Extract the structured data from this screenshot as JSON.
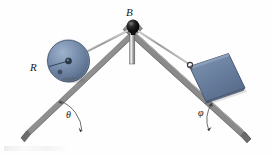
{
  "figure": {
    "type": "engineering-mechanics-diagram",
    "labels": {
      "apex": "B",
      "disk_radius": "R",
      "left_angle": "θ",
      "right_angle": "φ"
    },
    "colors": {
      "beam_light": "#d8d8d8",
      "beam_mid": "#a9a9a9",
      "beam_dark": "#6f6f6f",
      "body_fill": "#6f86a6",
      "body_dark": "#4f6480",
      "body_light": "#8ea2be",
      "pin": "#101010",
      "cable": "#9a9a9a",
      "baseline": "#8a8a8a",
      "label": "#1a1a1a"
    },
    "geometry": {
      "apex": [
        133,
        27
      ],
      "left_foot": [
        22,
        133
      ],
      "right_foot": [
        250,
        133
      ],
      "baseline_y": 131,
      "disk_center": [
        68,
        61
      ],
      "disk_radius_px": 21,
      "block_center": [
        206,
        72
      ],
      "theta_deg": 44,
      "phi_deg": 43
    },
    "elements": {
      "left_beam": "left-inclined-beam",
      "right_beam": "right-inclined-beam",
      "apex_post": "apex-vertical-post",
      "pin": "apex-pin-pulley",
      "left_cable": "cable-disk-to-apex",
      "right_cable": "cable-apex-to-block",
      "disk": "disk-on-left-incline",
      "block": "block-on-right-incline",
      "hook": "block-cable-hook",
      "baseline": "ground-horizontal-line",
      "theta_arc": "theta-angle-arc",
      "phi_arc": "phi-angle-arc"
    }
  }
}
